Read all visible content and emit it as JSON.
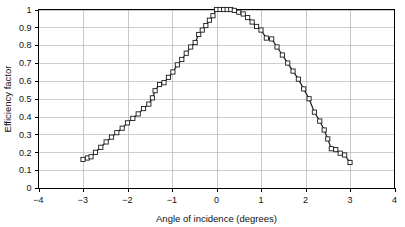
{
  "chart_data": {
    "type": "line",
    "title": "",
    "xlabel": "Angle of incidence (degrees)",
    "ylabel": "Efficiency factor",
    "xlim": [
      -4,
      4
    ],
    "ylim": [
      0,
      1
    ],
    "xticks": [
      -4,
      -3,
      -2,
      -1,
      0,
      1,
      2,
      3,
      4
    ],
    "xtick_labels": [
      "−4",
      "−3",
      "−2",
      "−1",
      "0",
      "1",
      "2",
      "3",
      "4"
    ],
    "yticks": [
      0,
      0.1,
      0.2,
      0.3,
      0.4,
      0.5,
      0.6,
      0.7,
      0.8,
      0.9,
      1
    ],
    "ytick_labels": [
      "0",
      "0.1",
      "0.2",
      "0.3",
      "0.4",
      "0.5",
      "0.6",
      "0.7",
      "0.8",
      "0.9",
      "1"
    ],
    "grid": "horizontal-and-vertical",
    "legend": "none",
    "marker": "open-square",
    "line_color": "#1a1a1a",
    "grid_color": "#b8b8b8",
    "background_color": "#ffffff",
    "series": [
      {
        "name": "Efficiency factor",
        "x": [
          -3.0,
          -2.9,
          -2.82,
          -2.72,
          -2.6,
          -2.48,
          -2.36,
          -2.24,
          -2.12,
          -2.0,
          -1.88,
          -1.76,
          -1.64,
          -1.52,
          -1.44,
          -1.38,
          -1.28,
          -1.18,
          -1.08,
          -0.98,
          -0.88,
          -0.78,
          -0.68,
          -0.58,
          -0.48,
          -0.4,
          -0.32,
          -0.24,
          -0.16,
          -0.08,
          0.0,
          0.08,
          0.16,
          0.24,
          0.32,
          0.4,
          0.5,
          0.6,
          0.7,
          0.8,
          0.9,
          1.0,
          1.12,
          1.24,
          1.36,
          1.48,
          1.6,
          1.72,
          1.84,
          1.96,
          2.08,
          2.2,
          2.32,
          2.42,
          2.5,
          2.58,
          2.68,
          2.78,
          2.88,
          3.0
        ],
        "y": [
          0.16,
          0.168,
          0.175,
          0.2,
          0.228,
          0.258,
          0.285,
          0.31,
          0.335,
          0.365,
          0.39,
          0.415,
          0.445,
          0.47,
          0.505,
          0.545,
          0.58,
          0.59,
          0.62,
          0.65,
          0.69,
          0.72,
          0.755,
          0.79,
          0.815,
          0.86,
          0.885,
          0.91,
          0.94,
          0.965,
          1.0,
          1.0,
          1.0,
          1.0,
          1.0,
          0.995,
          0.985,
          0.975,
          0.955,
          0.93,
          0.905,
          0.885,
          0.84,
          0.835,
          0.79,
          0.745,
          0.7,
          0.655,
          0.61,
          0.555,
          0.5,
          0.425,
          0.375,
          0.325,
          0.275,
          0.22,
          0.215,
          0.195,
          0.185,
          0.143
        ]
      }
    ]
  },
  "axes": {
    "x_title": "Angle of incidence (degrees)",
    "y_title": "Efficiency factor"
  }
}
